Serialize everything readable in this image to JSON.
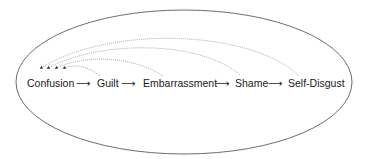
{
  "diagram": {
    "type": "emotion-progression",
    "container": "ellipse",
    "nodes": [
      {
        "id": "confusion",
        "label": "Confusion"
      },
      {
        "id": "guilt",
        "label": "Guilt"
      },
      {
        "id": "embarrassment",
        "label": "Embarrassment"
      },
      {
        "id": "shame",
        "label": "Shame"
      },
      {
        "id": "self-disgust",
        "label": "Self-Disgust"
      }
    ],
    "flow_arrow": "⟶",
    "forward_edges": [
      {
        "from": "confusion",
        "to": "guilt"
      },
      {
        "from": "guilt",
        "to": "embarrassment"
      },
      {
        "from": "embarrassment",
        "to": "shame"
      },
      {
        "from": "shame",
        "to": "self-disgust"
      }
    ],
    "feedback_edges": [
      {
        "from": "guilt",
        "to": "confusion",
        "style": "dotted"
      },
      {
        "from": "embarrassment",
        "to": "confusion",
        "style": "dotted"
      },
      {
        "from": "shame",
        "to": "confusion",
        "style": "dotted"
      },
      {
        "from": "self-disgust",
        "to": "confusion",
        "style": "dotted"
      }
    ],
    "colors": {
      "ellipse": "#6e6e6e",
      "text": "#1a1a1a",
      "dotted": "#9a9a9a"
    }
  }
}
